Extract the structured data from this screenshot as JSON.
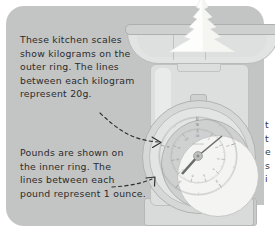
{
  "illustration": {
    "title": "Kitchen scales measurement annotation diagram",
    "panel_color": "#c3c4c4",
    "ink_color": "#2b2b2b"
  },
  "callouts": [
    {
      "id": "kilograms-note",
      "lines": [
        "These kitchen scales",
        "show kilograms on the",
        "outer ring. The lines",
        "between each kilogram",
        "represent 20g."
      ],
      "points_to": "outer-ring"
    },
    {
      "id": "pounds-note",
      "lines": [
        "Pounds are shown on",
        "the inner ring. The",
        "lines between each",
        "pound represent 1 ounce."
      ],
      "points_to": "inner-ring"
    }
  ],
  "edge_text": {
    "lines": [
      "t",
      "t",
      "e",
      "s",
      "i"
    ]
  },
  "scale": {
    "name": "mechanical kitchen scale",
    "body_color": "#dddede",
    "pan_color": "#e2e3e3",
    "dial_face_color": "#f4f4f2",
    "contents": "mound of flour",
    "dial": {
      "outer_ring_unit": "kilograms",
      "inner_ring_unit": "pounds",
      "outer_minor_division": "20g",
      "inner_minor_division": "1 ounce",
      "brand_mark": "",
      "needle_direction": "upper-right"
    }
  }
}
